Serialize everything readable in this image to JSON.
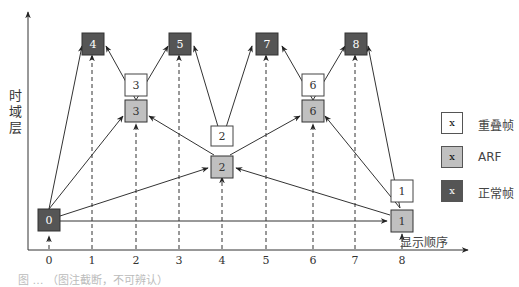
{
  "diagram": {
    "type": "hierarchical-B-frame temporal layer structure",
    "y_axis_label": "时域层",
    "x_axis_label": "显示顺序",
    "x_ticks": [
      "0",
      "1",
      "2",
      "3",
      "4",
      "5",
      "6",
      "7",
      "8"
    ],
    "frames": [
      {
        "id": "f0",
        "label": "0",
        "kind": "normal",
        "display_order": 0
      },
      {
        "id": "f1",
        "label": "1",
        "kind": "arf",
        "display_order": 8
      },
      {
        "id": "f1o",
        "label": "1",
        "kind": "overlay",
        "display_order": 8
      },
      {
        "id": "f2",
        "label": "2",
        "kind": "arf",
        "display_order": 4
      },
      {
        "id": "f2o",
        "label": "2",
        "kind": "overlay",
        "display_order": 4
      },
      {
        "id": "f3",
        "label": "3",
        "kind": "arf",
        "display_order": 2
      },
      {
        "id": "f3o",
        "label": "3",
        "kind": "overlay",
        "display_order": 2
      },
      {
        "id": "f6",
        "label": "6",
        "kind": "arf",
        "display_order": 6
      },
      {
        "id": "f6o",
        "label": "6",
        "kind": "overlay",
        "display_order": 6
      },
      {
        "id": "f4",
        "label": "4",
        "kind": "normal",
        "display_order": 1
      },
      {
        "id": "f5",
        "label": "5",
        "kind": "normal",
        "display_order": 3
      },
      {
        "id": "f7",
        "label": "7",
        "kind": "normal",
        "display_order": 5
      },
      {
        "id": "f8",
        "label": "8",
        "kind": "normal",
        "display_order": 7
      }
    ],
    "edges": [
      {
        "from": "0",
        "to": "1"
      },
      {
        "from": "0",
        "to": "2"
      },
      {
        "from": "0",
        "to": "3"
      },
      {
        "from": "0",
        "to": "4"
      },
      {
        "from": "1",
        "to": "2"
      },
      {
        "from": "1",
        "to": "6"
      },
      {
        "from": "1",
        "to": "8"
      },
      {
        "from": "2",
        "to": "3"
      },
      {
        "from": "2",
        "to": "5"
      },
      {
        "from": "2",
        "to": "6"
      },
      {
        "from": "2",
        "to": "7"
      },
      {
        "from": "3",
        "to": "4"
      },
      {
        "from": "3",
        "to": "5"
      },
      {
        "from": "6",
        "to": "7"
      },
      {
        "from": "6",
        "to": "8"
      }
    ],
    "caption": "图 … （图注截断，不可辨认）"
  },
  "legend": {
    "items": [
      {
        "symbol": "x",
        "label": "重叠帧",
        "kind": "overlay"
      },
      {
        "symbol": "x",
        "label": "ARF",
        "kind": "arf"
      },
      {
        "symbol": "x",
        "label": "正常帧",
        "kind": "normal"
      }
    ]
  },
  "colors": {
    "normal_fill": "#555555",
    "normal_text": "#ffffff",
    "arf_fill": "#c0c0c0",
    "overlay_fill": "#ffffff",
    "line": "#333333"
  }
}
